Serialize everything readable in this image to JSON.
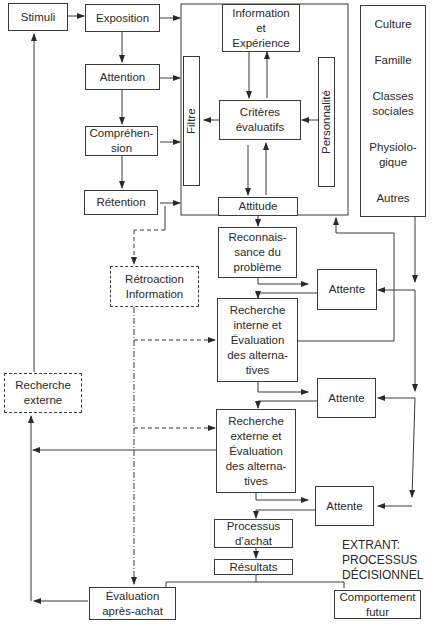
{
  "diagram": {
    "nodes": {
      "stimuli": "Stimuli",
      "exposition": "Exposition",
      "attention": "Attention",
      "comprehension": "Compréhen-\nsion",
      "retention": "Rétention",
      "information_experience": "Information\net\nExpérience",
      "filtre": "Filtre",
      "criteres": "Critères\névaluatifs",
      "personnalite": "Personnalité",
      "attitude": "Attitude",
      "influences": [
        "Culture",
        "Famille",
        "Classes\nsociales",
        "Physiolo-\ngique",
        "Autres"
      ],
      "reconnaissance": "Reconnais-\nsance du\nproblème",
      "retroaction": "Rétroaction\nInformation",
      "recherche_interne": "Recherche\ninterne et\nÉvaluation\ndes alterna-\ntives",
      "recherche_externe_dashed": "Recherche\nexterne",
      "recherche_externe_eval": "Recherche\nexterne et\nÉvaluation\ndes alterna-\ntives",
      "attente_1": "Attente",
      "attente_2": "Attente",
      "attente_3": "Attente",
      "processus_achat": "Processus\nd’achat",
      "resultats": "Résultats",
      "evaluation_apres_achat": "Évaluation\naprès-achat",
      "comportement_futur": "Comportement\nfutur"
    },
    "caption": "EXTRANT:\nPROCESSUS\nDÉCISIONNEL"
  }
}
